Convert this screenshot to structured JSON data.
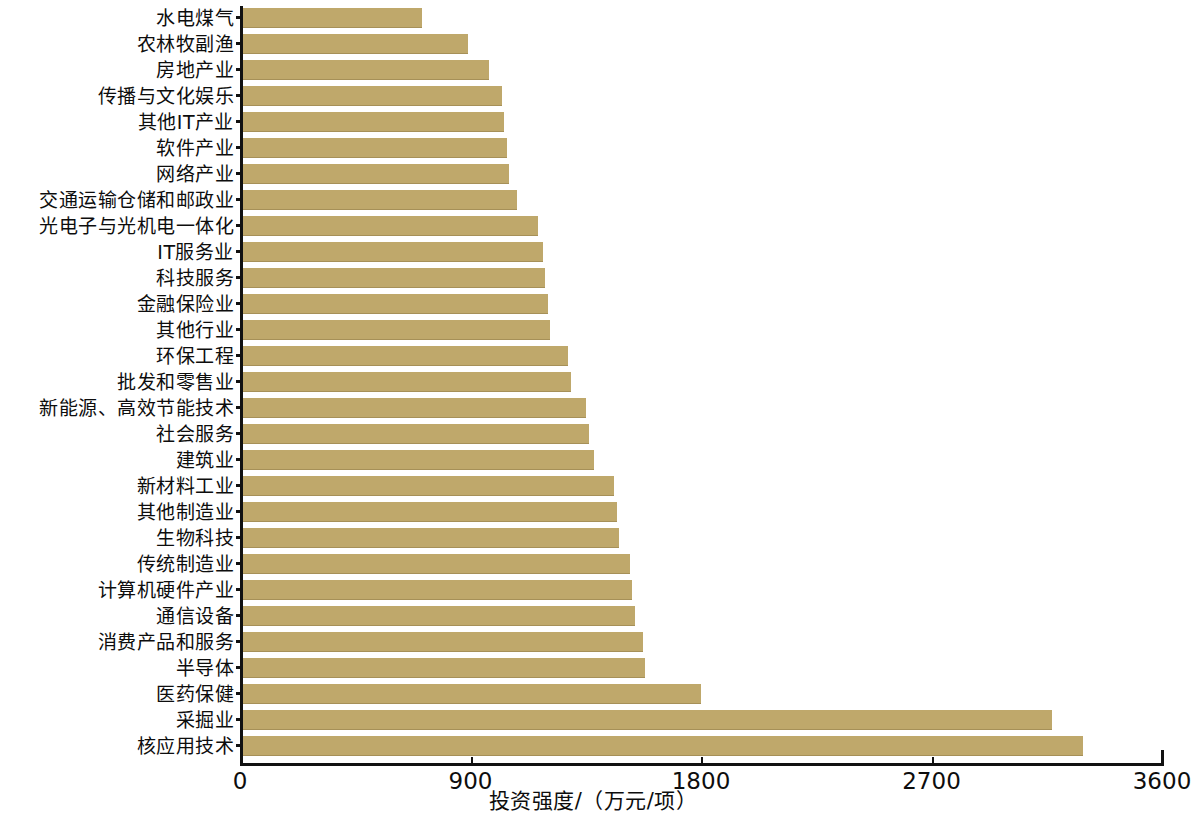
{
  "chart_data": {
    "type": "bar",
    "orientation": "horizontal",
    "title": "",
    "xlabel": "投资强度/（万元/项）",
    "ylabel": "",
    "xlim": [
      0,
      3600
    ],
    "xticks": [
      "0",
      "900",
      "1800",
      "2700",
      "3600"
    ],
    "xtick_values": [
      0,
      900,
      1800,
      2700,
      3600
    ],
    "grid": false,
    "legend": false,
    "bar_color": "#bfa86b",
    "axis_color": "#111111",
    "categories": [
      "水电煤气",
      "农林牧副渔",
      "房地产业",
      "传播与文化娱乐",
      "其他IT产业",
      "软件产业",
      "网络产业",
      "交通运输仓储和邮政业",
      "光电子与光机电一体化",
      "IT服务业",
      "科技服务",
      "金融保险业",
      "其他行业",
      "环保工程",
      "批发和零售业",
      "新能源、高效节能技术",
      "社会服务",
      "建筑业",
      "新材料工业",
      "其他制造业",
      "生物科技",
      "传统制造业",
      "计算机硬件产业",
      "通信设备",
      "消费产品和服务",
      "半导体",
      "医药保健",
      "采掘业",
      "核应用技术"
    ],
    "values": [
      700,
      880,
      960,
      1010,
      1020,
      1030,
      1040,
      1070,
      1150,
      1170,
      1180,
      1190,
      1200,
      1270,
      1280,
      1340,
      1350,
      1370,
      1450,
      1460,
      1470,
      1510,
      1520,
      1530,
      1560,
      1570,
      1790,
      3160,
      3280
    ]
  }
}
